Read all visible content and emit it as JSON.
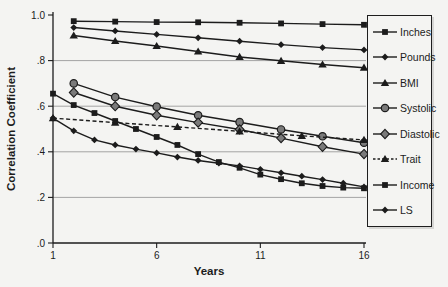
{
  "figure": {
    "background": "#f4f4f2",
    "ink_color": "#1c1c1c",
    "grid_color": "#9b9b9b",
    "marker_gray_fill": "#7a7a7a"
  },
  "chart_data": {
    "type": "line",
    "xlabel": "Years",
    "ylabel": "Correlation Coefficient",
    "xlim": [
      1,
      16
    ],
    "ylim": [
      0.0,
      1.0
    ],
    "x_ticks": {
      "values": [
        1,
        6,
        11,
        16
      ],
      "labels": [
        "1",
        "6",
        "11",
        "16"
      ]
    },
    "y_ticks": {
      "values": [
        1.0,
        0.8,
        0.6,
        0.4,
        0.2,
        0.0
      ],
      "labels": [
        "1.0",
        ".8",
        ".6",
        ".4",
        ".2",
        ".0"
      ]
    },
    "gridlines": [
      0.8,
      0.6,
      0.4,
      0.2
    ],
    "grid": "horizontal-only",
    "legend_position": "right-outside",
    "series": [
      {
        "name": "Inches",
        "marker": "square",
        "line": "solid",
        "x": [
          2,
          4,
          6,
          8,
          10,
          12,
          14,
          16
        ],
        "y": [
          0.973,
          0.971,
          0.969,
          0.968,
          0.966,
          0.963,
          0.96,
          0.957
        ]
      },
      {
        "name": "Pounds",
        "marker": "diamond-small",
        "line": "solid",
        "x": [
          2,
          4,
          6,
          8,
          10,
          12,
          14,
          16
        ],
        "y": [
          0.945,
          0.93,
          0.915,
          0.9,
          0.885,
          0.87,
          0.857,
          0.847
        ]
      },
      {
        "name": "BMI",
        "marker": "triangle",
        "line": "solid",
        "x": [
          2,
          4,
          6,
          8,
          10,
          12,
          14,
          16
        ],
        "y": [
          0.91,
          0.886,
          0.864,
          0.84,
          0.816,
          0.799,
          0.783,
          0.769
        ]
      },
      {
        "name": "Systolic",
        "marker": "circle",
        "line": "solid",
        "x": [
          2,
          4,
          6,
          8,
          10,
          12,
          14,
          16
        ],
        "y": [
          0.7,
          0.64,
          0.598,
          0.56,
          0.53,
          0.498,
          0.468,
          0.44
        ]
      },
      {
        "name": "Diastolic",
        "marker": "diamond",
        "line": "solid",
        "x": [
          2,
          4,
          6,
          8,
          10,
          12,
          14,
          16
        ],
        "y": [
          0.66,
          0.6,
          0.56,
          0.528,
          0.498,
          0.46,
          0.422,
          0.39
        ]
      },
      {
        "name": "Trait",
        "marker": "triangle",
        "line": "dashed",
        "x": [
          1,
          4,
          7,
          10,
          13,
          16
        ],
        "y": [
          0.548,
          0.528,
          0.509,
          0.49,
          0.47,
          0.452
        ]
      },
      {
        "name": "Income",
        "marker": "square",
        "line": "solid",
        "x": [
          1,
          2,
          3,
          4,
          5,
          6,
          7,
          8,
          9,
          10,
          11,
          12,
          13,
          14,
          15,
          16
        ],
        "y": [
          0.655,
          0.605,
          0.57,
          0.535,
          0.5,
          0.465,
          0.43,
          0.39,
          0.355,
          0.33,
          0.3,
          0.28,
          0.262,
          0.25,
          0.243,
          0.24
        ]
      },
      {
        "name": "LS",
        "marker": "diamond-small",
        "line": "solid",
        "x": [
          1,
          2,
          3,
          4,
          5,
          6,
          7,
          8,
          9,
          10,
          11,
          12,
          13,
          14,
          15,
          16
        ],
        "y": [
          0.548,
          0.492,
          0.452,
          0.43,
          0.412,
          0.395,
          0.377,
          0.362,
          0.35,
          0.338,
          0.323,
          0.308,
          0.293,
          0.278,
          0.262,
          0.246
        ]
      }
    ]
  }
}
